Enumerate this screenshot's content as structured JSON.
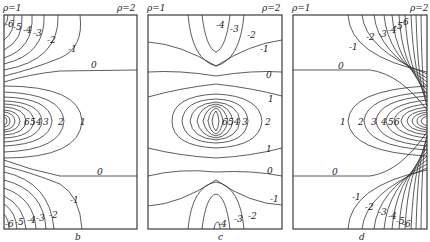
{
  "figure": {
    "panels": [
      {
        "id": "b",
        "caption": "b",
        "rho_left": "ρ=1",
        "rho_right": "ρ=2",
        "labels": {
          "top": [
            "-6",
            "-5",
            "-4",
            "-3",
            "-2",
            "-1"
          ],
          "upper_zero": "0",
          "middle": [
            "6",
            "5",
            "4",
            "3",
            "2",
            "1"
          ],
          "lower_zero": "0",
          "bottom": [
            "-6",
            "-5",
            "-4",
            "-3",
            "-2",
            "-1"
          ]
        }
      },
      {
        "id": "c",
        "caption": "c",
        "rho_left": "ρ=1",
        "rho_right": "ρ=2",
        "labels": {
          "top": [
            "-4",
            "-3",
            "-2",
            "-1"
          ],
          "upper_zero": "0",
          "upper_one": "1",
          "middle": [
            "6",
            "5",
            "4",
            "3",
            "2"
          ],
          "lower_one": "1",
          "lower_zero": "0",
          "bottom": [
            "-1",
            "-2",
            "-3",
            "-4"
          ]
        }
      },
      {
        "id": "d",
        "caption": "d",
        "rho_left": "ρ=1",
        "rho_right": "ρ=2",
        "labels": {
          "top": [
            "-1",
            "-2",
            "-3",
            "-4",
            "-5",
            "-6"
          ],
          "upper_zero": "0",
          "middle": [
            "1",
            "2",
            "3",
            "4",
            "5",
            "6"
          ],
          "lower_zero": "0",
          "bottom": [
            "-1",
            "-2",
            "-3",
            "-4",
            "-5",
            "-6"
          ]
        }
      }
    ]
  }
}
